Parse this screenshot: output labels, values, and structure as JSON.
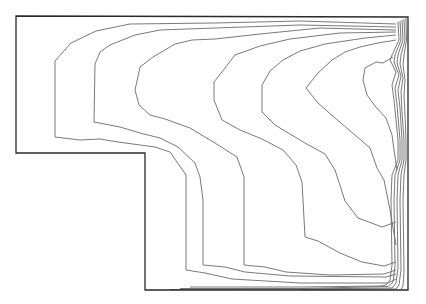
{
  "figure": {
    "type": "contour-plot",
    "stroke_color": "#6a6a6a",
    "boundary_color": "#2a2a2a",
    "background": "#ffffff"
  },
  "boundary": [
    [
      16,
      16
    ],
    [
      408,
      17
    ],
    [
      408,
      290
    ],
    [
      145,
      290
    ],
    [
      145,
      153
    ],
    [
      16,
      153
    ]
  ],
  "contours": [
    [
      [
        396,
        24
      ],
      [
        300,
        21
      ],
      [
        215,
        23
      ],
      [
        130,
        24
      ],
      [
        96,
        31
      ],
      [
        71,
        43
      ],
      [
        55,
        61
      ],
      [
        55,
        137
      ],
      [
        80,
        140
      ],
      [
        100,
        139
      ],
      [
        118,
        142
      ],
      [
        155,
        147
      ],
      [
        170,
        152
      ],
      [
        186,
        175
      ],
      [
        186,
        270
      ],
      [
        205,
        273
      ],
      [
        232,
        279
      ],
      [
        300,
        283
      ],
      [
        388,
        283
      ],
      [
        396,
        279
      ]
    ],
    [
      [
        396,
        27
      ],
      [
        300,
        25
      ],
      [
        215,
        28
      ],
      [
        160,
        30
      ],
      [
        135,
        35
      ],
      [
        110,
        45
      ],
      [
        100,
        52
      ],
      [
        95,
        64
      ],
      [
        94,
        122
      ],
      [
        120,
        127
      ],
      [
        140,
        133
      ],
      [
        160,
        138
      ],
      [
        178,
        147
      ],
      [
        195,
        163
      ],
      [
        200,
        177
      ],
      [
        203,
        200
      ],
      [
        203,
        265
      ],
      [
        225,
        267
      ],
      [
        245,
        272
      ],
      [
        290,
        276
      ],
      [
        386,
        277
      ],
      [
        396,
        274
      ]
    ],
    [
      [
        396,
        30
      ],
      [
        320,
        28
      ],
      [
        260,
        34
      ],
      [
        215,
        39
      ],
      [
        192,
        40
      ],
      [
        175,
        44
      ],
      [
        153,
        57
      ],
      [
        140,
        67
      ],
      [
        135,
        90
      ],
      [
        139,
        105
      ],
      [
        150,
        115
      ],
      [
        165,
        119
      ],
      [
        190,
        128
      ],
      [
        215,
        143
      ],
      [
        237,
        157
      ],
      [
        244,
        177
      ],
      [
        244,
        265
      ],
      [
        265,
        267
      ],
      [
        286,
        272
      ],
      [
        330,
        275
      ],
      [
        384,
        274
      ],
      [
        396,
        270
      ]
    ],
    [
      [
        396,
        32
      ],
      [
        340,
        33
      ],
      [
        290,
        39
      ],
      [
        260,
        46
      ],
      [
        235,
        55
      ],
      [
        225,
        68
      ],
      [
        214,
        82
      ],
      [
        214,
        100
      ],
      [
        222,
        120
      ],
      [
        240,
        130
      ],
      [
        262,
        139
      ],
      [
        283,
        150
      ],
      [
        296,
        165
      ],
      [
        302,
        182
      ],
      [
        305,
        237
      ],
      [
        318,
        241
      ],
      [
        340,
        253
      ],
      [
        362,
        262
      ],
      [
        384,
        266
      ],
      [
        396,
        262
      ]
    ],
    [
      [
        396,
        35
      ],
      [
        365,
        38
      ],
      [
        345,
        41
      ],
      [
        325,
        44
      ],
      [
        300,
        51
      ],
      [
        283,
        60
      ],
      [
        270,
        71
      ],
      [
        262,
        85
      ],
      [
        262,
        112
      ],
      [
        275,
        125
      ],
      [
        305,
        143
      ],
      [
        325,
        154
      ],
      [
        335,
        170
      ],
      [
        345,
        201
      ],
      [
        358,
        218
      ],
      [
        382,
        227
      ],
      [
        396,
        222
      ]
    ],
    [
      [
        396,
        40
      ],
      [
        378,
        43
      ],
      [
        360,
        47
      ],
      [
        345,
        52
      ],
      [
        332,
        60
      ],
      [
        318,
        73
      ],
      [
        306,
        88
      ],
      [
        318,
        103
      ],
      [
        335,
        118
      ],
      [
        355,
        135
      ],
      [
        370,
        148
      ],
      [
        377,
        168
      ],
      [
        384,
        180
      ],
      [
        390,
        210
      ],
      [
        393,
        228
      ],
      [
        396,
        245
      ]
    ],
    [
      [
        393,
        57
      ],
      [
        383,
        63
      ],
      [
        376,
        62
      ],
      [
        365,
        68
      ],
      [
        363,
        80
      ],
      [
        367,
        95
      ],
      [
        375,
        106
      ],
      [
        386,
        118
      ],
      [
        392,
        135
      ],
      [
        394,
        150
      ],
      [
        397,
        170
      ]
    ],
    [
      [
        398,
        22
      ],
      [
        399,
        40
      ],
      [
        392,
        55
      ],
      [
        390,
        60
      ],
      [
        396,
        72
      ],
      [
        392,
        85
      ],
      [
        394,
        100
      ],
      [
        398,
        140
      ],
      [
        398,
        160
      ],
      [
        392,
        175
      ],
      [
        391,
        200
      ],
      [
        392,
        265
      ],
      [
        390,
        280
      ],
      [
        386,
        285
      ],
      [
        380,
        286
      ],
      [
        300,
        287
      ],
      [
        190,
        287
      ]
    ],
    [
      [
        400,
        21
      ],
      [
        401,
        40
      ],
      [
        395,
        55
      ],
      [
        394,
        62
      ],
      [
        399,
        75
      ],
      [
        395,
        88
      ],
      [
        397,
        105
      ],
      [
        400,
        140
      ],
      [
        400,
        160
      ],
      [
        395,
        175
      ],
      [
        394,
        200
      ],
      [
        395,
        266
      ],
      [
        393,
        282
      ],
      [
        388,
        286.5
      ],
      [
        300,
        288.5
      ],
      [
        180,
        288.5
      ]
    ],
    [
      [
        402,
        20
      ],
      [
        403,
        40
      ],
      [
        398,
        55
      ],
      [
        397,
        63
      ],
      [
        401,
        76
      ],
      [
        398,
        90
      ],
      [
        400,
        108
      ],
      [
        402,
        140
      ],
      [
        402,
        160
      ],
      [
        398,
        175
      ],
      [
        397,
        200
      ],
      [
        398,
        268
      ],
      [
        396,
        283
      ],
      [
        392,
        288
      ],
      [
        300,
        289
      ],
      [
        170,
        289.5
      ]
    ],
    [
      [
        404,
        19
      ],
      [
        405,
        40
      ],
      [
        401,
        55
      ],
      [
        400,
        64
      ],
      [
        403,
        78
      ],
      [
        401,
        92
      ],
      [
        402,
        112
      ],
      [
        404,
        140
      ],
      [
        404,
        160
      ],
      [
        401,
        175
      ],
      [
        400,
        200
      ],
      [
        401,
        270
      ],
      [
        399,
        285
      ],
      [
        396,
        289
      ],
      [
        300,
        289.5
      ]
    ],
    [
      [
        406,
        18
      ],
      [
        406.5,
        40
      ],
      [
        404,
        55
      ],
      [
        403,
        65
      ],
      [
        405,
        80
      ],
      [
        404,
        95
      ],
      [
        405,
        115
      ],
      [
        406,
        140
      ],
      [
        406,
        160
      ],
      [
        404,
        175
      ],
      [
        403,
        200
      ],
      [
        404,
        272
      ],
      [
        403,
        286
      ],
      [
        401,
        289.5
      ]
    ]
  ]
}
